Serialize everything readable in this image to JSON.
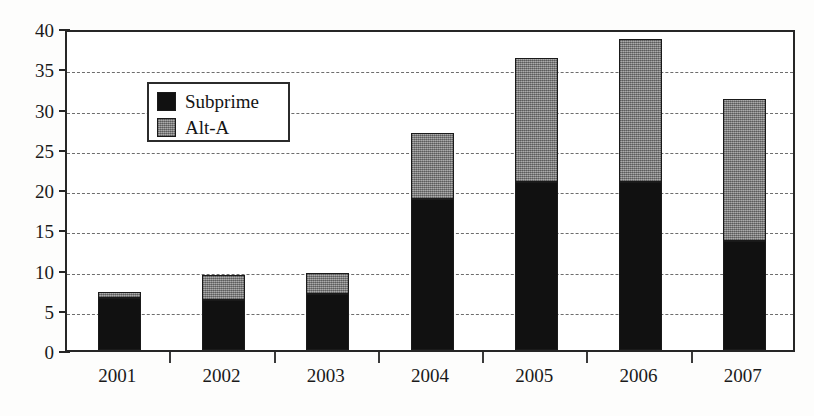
{
  "chart_data": {
    "type": "bar",
    "subtype": "stacked-vertical",
    "title": "",
    "xlabel": "",
    "ylabel": "",
    "categories": [
      "2001",
      "2002",
      "2003",
      "2004",
      "2005",
      "2006",
      "2007"
    ],
    "series": [
      {
        "name": "Subprime",
        "color": "#111111",
        "values": [
          6.5,
          6.2,
          7.0,
          18.8,
          20.9,
          20.9,
          13.5
        ]
      },
      {
        "name": "Alt-A",
        "color": "#8d8d8d",
        "values": [
          0.7,
          3.1,
          2.6,
          8.2,
          15.4,
          17.7,
          17.7
        ]
      }
    ],
    "totals": [
      7.2,
      9.3,
      9.6,
      27.0,
      36.3,
      38.6,
      31.2
    ],
    "ylim": [
      0,
      40
    ],
    "yticks": [
      0,
      5,
      10,
      15,
      20,
      25,
      30,
      35,
      40
    ],
    "ytick_labels": [
      "0",
      "5",
      "10",
      "15",
      "20",
      "25",
      "30",
      "35",
      "40"
    ],
    "grid": true,
    "grid_style": "dashed-horizontal",
    "legend_position": "top-left-inside",
    "legend_entries": [
      "Subprime",
      "Alt-A"
    ],
    "axis_color": "#262626",
    "grid_color": "#6d6d6d",
    "background": "#ffffff"
  }
}
